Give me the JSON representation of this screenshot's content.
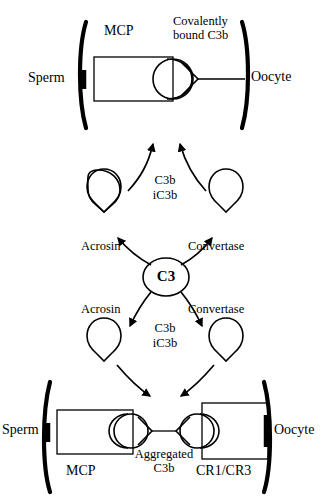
{
  "figure": {
    "background_color": "#ffffff",
    "stroke_color": "#000000",
    "width": 328,
    "height": 504
  },
  "top_panel": {
    "sperm_label": "Sperm",
    "oocyte_label": "Oocyte",
    "mcp_label": "MCP",
    "covalent_label_line1": "Covalently",
    "covalent_label_line2": "bound C3b"
  },
  "upper_products": {
    "c3b_label": "C3b",
    "ic3b_label": "iC3b"
  },
  "upper_enzymes": {
    "left_label": "Acrosin",
    "right_label": "Convertase"
  },
  "center": {
    "c3_label": "C3"
  },
  "lower_enzymes": {
    "left_label": "Acrosin",
    "right_label": "Convertase"
  },
  "lower_products": {
    "c3b_label": "C3b",
    "ic3b_label": "iC3b"
  },
  "bottom_panel": {
    "sperm_label": "Sperm",
    "oocyte_label": "Oocyte",
    "mcp_label": "MCP",
    "receptor_label": "CR1/CR3",
    "aggregated_label_line1": "Aggregated",
    "aggregated_label_line2": "C3b"
  }
}
